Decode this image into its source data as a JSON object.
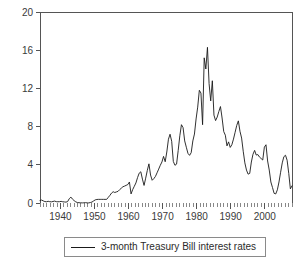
{
  "chart_data": {
    "type": "line",
    "title": "",
    "xlabel": "",
    "ylabel": "",
    "xlim": [
      1934,
      2008
    ],
    "ylim": [
      0,
      20
    ],
    "grid": false,
    "legend_position": "below",
    "y_ticks": [
      0,
      4,
      8,
      12,
      16,
      20
    ],
    "y_tick_labels": [
      "0",
      "4",
      "8",
      "12",
      "16",
      "20"
    ],
    "x_ticks": [
      1940,
      1950,
      1960,
      1970,
      1980,
      1990,
      2000
    ],
    "x_tick_labels": [
      "1940",
      "1950",
      "1960",
      "1970",
      "1980",
      "1990",
      "2000"
    ],
    "x_minor_tick_step": 1,
    "series": [
      {
        "name": "3-month Treasury Bill interest rates",
        "color": "#1a1a1a",
        "x": [
          1934,
          1935,
          1936,
          1937,
          1938,
          1939,
          1940,
          1941,
          1942,
          1943,
          1944,
          1945,
          1946,
          1947,
          1948,
          1949,
          1950,
          1951,
          1952,
          1953,
          1954,
          1955,
          1956,
          1957,
          1958,
          1959,
          1960,
          1961,
          1962,
          1963,
          1964,
          1965,
          1966,
          1967,
          1968,
          1969,
          1970,
          1971,
          1972,
          1973,
          1974,
          1975,
          1976,
          1977,
          1978,
          1979,
          1980,
          1981,
          1982,
          1983,
          1984,
          1985,
          1986,
          1987,
          1988,
          1989,
          1990,
          1991,
          1992,
          1993,
          1994,
          1995,
          1996,
          1997,
          1998,
          1999,
          2000,
          2001,
          2002,
          2003,
          2004,
          2005,
          2006,
          2007,
          2008
        ],
        "values": [
          0.26,
          0.14,
          0.14,
          0.45,
          0.05,
          0.02,
          0.01,
          0.1,
          0.33,
          0.37,
          0.38,
          0.38,
          0.38,
          0.59,
          1.04,
          1.1,
          1.22,
          1.55,
          1.77,
          1.93,
          0.95,
          1.75,
          2.66,
          3.27,
          1.84,
          3.41,
          2.93,
          2.38,
          2.78,
          3.16,
          3.55,
          3.95,
          4.88,
          4.32,
          5.34,
          6.68,
          6.46,
          4.35,
          4.07,
          7.04,
          7.89,
          5.84,
          4.99,
          5.27,
          7.22,
          10.04,
          11.51,
          14.03,
          10.69,
          8.63,
          9.58,
          7.48,
          5.98,
          5.82,
          6.69,
          8.12,
          7.51,
          5.42,
          3.45,
          3.02,
          4.29,
          5.51,
          5.02,
          5.07,
          4.81,
          4.66,
          5.85,
          3.45,
          1.62,
          1.01,
          1.38,
          3.22,
          4.85,
          4.48,
          1.48
        ],
        "monthly_detail": [
          0.26,
          0.31,
          0.22,
          0.15,
          0.13,
          0.18,
          0.14,
          0.12,
          0.16,
          0.2,
          0.14,
          0.13,
          0.14,
          0.17,
          0.13,
          0.11,
          0.09,
          0.15,
          0.45,
          0.62,
          0.4,
          0.25,
          0.12,
          0.05,
          0.03,
          0.02,
          0.01,
          0.02,
          0.04,
          0.01,
          0.01,
          0.05,
          0.1,
          0.22,
          0.33,
          0.37,
          0.38,
          0.38,
          0.38,
          0.38,
          0.38,
          0.38,
          0.59,
          0.8,
          1.04,
          1.18,
          1.1,
          1.16,
          1.22,
          1.4,
          1.55,
          1.7,
          1.77,
          1.85,
          1.93,
          2.2,
          0.95,
          1.4,
          1.75,
          2.1,
          2.66,
          3.12,
          3.27,
          2.5,
          1.84,
          2.6,
          3.41,
          4.1,
          2.93,
          2.38,
          2.55,
          2.78,
          3.16,
          3.55,
          3.95,
          4.3,
          4.88,
          4.32,
          5.34,
          6.68,
          7.2,
          6.46,
          4.35,
          3.95,
          4.07,
          5.5,
          7.04,
          8.2,
          7.89,
          6.5,
          5.84,
          5.2,
          4.99,
          5.27,
          6.5,
          7.22,
          8.8,
          10.04,
          11.8,
          11.51,
          8.2,
          15.2,
          14.03,
          16.3,
          12.5,
          10.69,
          12.8,
          9.2,
          8.63,
          9.0,
          9.58,
          10.1,
          8.9,
          7.48,
          7.1,
          5.98,
          6.4,
          5.82,
          6.1,
          6.69,
          7.4,
          8.12,
          8.6,
          7.51,
          6.8,
          5.42,
          4.2,
          3.45,
          3.02,
          3.1,
          4.29,
          5.1,
          5.51,
          5.02,
          5.07,
          4.81,
          4.66,
          4.5,
          5.85,
          6.1,
          4.4,
          3.45,
          2.2,
          1.62,
          1.01,
          0.95,
          1.38,
          2.2,
          3.22,
          4.2,
          4.85,
          5.0,
          4.48,
          3.1,
          1.48,
          1.8
        ]
      }
    ]
  },
  "legend": {
    "entries": [
      {
        "label": "3-month Treasury Bill interest rates",
        "marker": "line",
        "color": "#1a1a1a"
      }
    ]
  },
  "colors": {
    "background": "#ffffff",
    "axis": "#555555",
    "series": "#1a1a1a",
    "text": "#3a3a3a",
    "legend_border": "#8a8a8a"
  }
}
